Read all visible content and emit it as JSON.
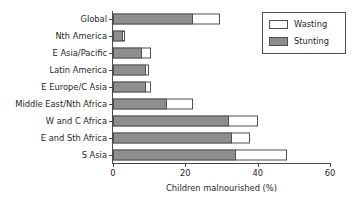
{
  "chart_data": {
    "type": "bar",
    "orientation": "horizontal",
    "stacked": true,
    "title": "",
    "xlabel": "Children malnourished (%)",
    "ylabel": "",
    "xlim": [
      0,
      60
    ],
    "xticks": [
      0,
      20,
      40,
      60
    ],
    "xtick_labels": [
      "0",
      "20",
      "40",
      "60"
    ],
    "grid": false,
    "legend_position": "top-right",
    "categories": [
      "Global",
      "Nth America",
      "E Asia/Pacific",
      "Latin America",
      "E Europe/C Asia",
      "Middle East/Nth Africa",
      "W and C Africa",
      "E and Sth Africa",
      "S Asia"
    ],
    "series": [
      {
        "name": "Stunting",
        "color": "#8e8e8e",
        "values": [
          22,
          2.7,
          8,
          9,
          9,
          15,
          32,
          33,
          34
        ]
      },
      {
        "name": "Wasting",
        "color": "#ffffff",
        "values": [
          7.5,
          0.5,
          2.5,
          1,
          1.5,
          7,
          8,
          5,
          14
        ]
      }
    ],
    "totals": [
      29.5,
      3.2,
      10.5,
      10,
      10.5,
      22,
      40,
      38,
      48
    ]
  },
  "legend": {
    "entries": [
      {
        "label": "Wasting",
        "swatch": "wasting"
      },
      {
        "label": "Stunting",
        "swatch": "stunting"
      }
    ]
  }
}
